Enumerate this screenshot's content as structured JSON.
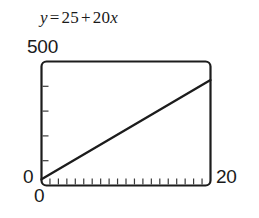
{
  "title": {
    "lhs": "y",
    "equals": "=",
    "intercept": "25",
    "plus": "+",
    "slope": "20",
    "variable": "x",
    "full": "y = 25 + 20x"
  },
  "labels": {
    "y_max": "500",
    "y_origin": "0",
    "x_origin": "0",
    "x_max": "20"
  },
  "colors": {
    "ink": "#1c1c1c",
    "tick": "#3a3a3a",
    "background": "#ffffff"
  },
  "chart_data": {
    "type": "line",
    "xlabel": "",
    "ylabel": "",
    "xlim": [
      0,
      20
    ],
    "ylim": [
      0,
      500
    ],
    "grid": false,
    "legend": null,
    "equation": "y = 25 + 20x",
    "intercept": 25,
    "slope": 20,
    "x_tick_count": 19,
    "x_tick_step": 1,
    "y_tick_count": 4,
    "y_tick_step": 100,
    "x_tick_labels": [
      "0",
      "20"
    ],
    "y_tick_labels": [
      "0",
      "500"
    ],
    "series": [
      {
        "name": "y = 25 + 20x",
        "x": [
          0,
          20
        ],
        "values": [
          25,
          425
        ]
      }
    ],
    "points": [
      {
        "x": 0,
        "y": 25
      },
      {
        "x": 5,
        "y": 125
      },
      {
        "x": 10,
        "y": 225
      },
      {
        "x": 15,
        "y": 325
      },
      {
        "x": 20,
        "y": 425
      }
    ]
  }
}
